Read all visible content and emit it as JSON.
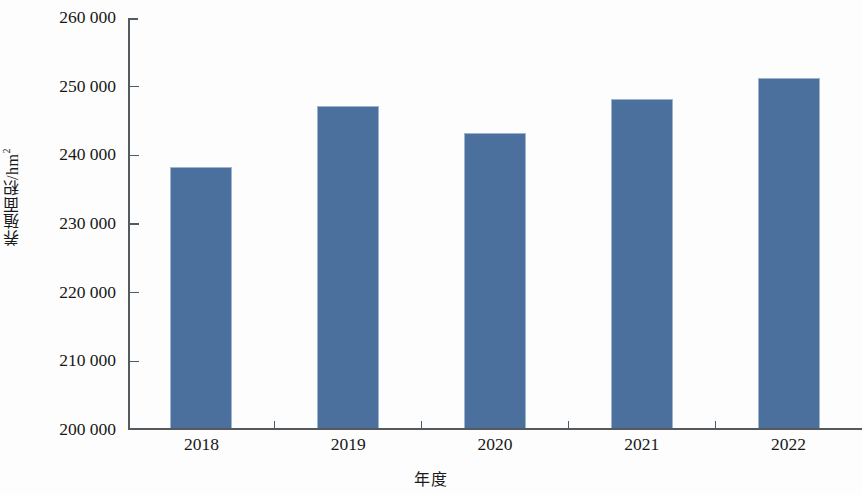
{
  "chart_data": {
    "type": "bar",
    "title": "",
    "xlabel": "年度",
    "ylabel": "养殖面积/hm2",
    "ylabel_base": "养殖面积/hm",
    "ylabel_sup": "2",
    "categories": [
      "2018",
      "2019",
      "2020",
      "2021",
      "2022"
    ],
    "values": [
      238000,
      247000,
      243000,
      248000,
      251000
    ],
    "ylim": [
      200000,
      260000
    ],
    "ytick_values": [
      200000,
      210000,
      220000,
      230000,
      240000,
      250000,
      260000
    ],
    "ytick_labels": [
      "200 000",
      "210 000",
      "220 000",
      "230 000",
      "240 000",
      "250 000",
      "260 000"
    ],
    "grid": false,
    "legend": false,
    "legend_position": "none",
    "bar_color": "#4c709e",
    "bar_edge_color": "#9fb4cd",
    "axis_color": "#555a5e",
    "background_color": "#fdfdfd",
    "series": [
      {
        "name": "养殖面积",
        "values": [
          238000,
          247000,
          243000,
          248000,
          251000
        ]
      }
    ]
  }
}
